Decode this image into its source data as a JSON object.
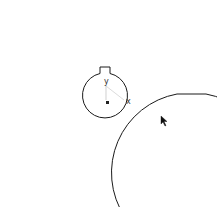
{
  "drawing": {
    "type": "cam-profile",
    "axis_labels": {
      "x": "x",
      "y": "y"
    },
    "origin_marker": "square",
    "line_color": "#1a1a1a",
    "axis_color": "#bbbbbb"
  },
  "cursor": {
    "icon": "arrow-cursor-icon",
    "x": 161,
    "y": 116
  }
}
